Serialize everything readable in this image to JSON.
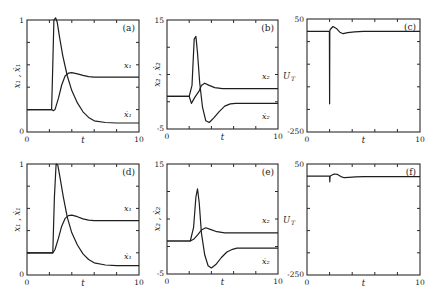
{
  "figure": {
    "width": 438,
    "height": 302
  },
  "chart_data": [
    {
      "id": "a",
      "type": "line",
      "panel_label": "(a)",
      "xlabel": "t",
      "ylabel": "x₁ , ẋ₁",
      "xlim": [
        0,
        10
      ],
      "ylim": [
        0,
        1
      ],
      "xtick_labels": [
        "0",
        "10"
      ],
      "ytick_labels": [
        "0",
        "1"
      ],
      "xticks": [
        0,
        2,
        4,
        6,
        8,
        10
      ],
      "yticks": [
        0,
        0.2,
        0.4,
        0.6,
        0.8,
        1
      ],
      "box": [
        27,
        20,
        139,
        132
      ],
      "series": [
        {
          "name": "x₁",
          "label_pos": [
            9.0,
            0.57
          ],
          "x": [
            0,
            2.2,
            2.35,
            2.5,
            2.8,
            3.1,
            3.4,
            3.7,
            4.0,
            4.5,
            5.0,
            5.5,
            6.0,
            7.0,
            8.0,
            10
          ],
          "y": [
            0.2,
            0.2,
            0.19,
            0.2,
            0.3,
            0.42,
            0.5,
            0.525,
            0.53,
            0.52,
            0.505,
            0.495,
            0.49,
            0.49,
            0.49,
            0.49
          ]
        },
        {
          "name": "ẋ₁",
          "label_pos": [
            9.0,
            0.13
          ],
          "x": [
            0,
            2.2,
            2.3,
            2.4,
            2.55,
            2.7,
            2.9,
            3.2,
            3.6,
            4.0,
            4.5,
            5.0,
            5.5,
            6.0,
            7.0,
            8.0,
            10
          ],
          "y": [
            0.2,
            0.2,
            0.6,
            1.0,
            1.02,
            0.98,
            0.85,
            0.68,
            0.5,
            0.37,
            0.26,
            0.18,
            0.13,
            0.1,
            0.085,
            0.08,
            0.08
          ]
        }
      ]
    },
    {
      "id": "b",
      "type": "line",
      "panel_label": "(b)",
      "xlabel": "t",
      "ylabel": "x₂ , ẋ₂",
      "xlim": [
        0,
        10
      ],
      "ylim": [
        -5,
        15
      ],
      "xtick_labels": [
        "0",
        "10"
      ],
      "ytick_labels": [
        "-5",
        "15"
      ],
      "xticks": [
        0,
        2,
        4,
        6,
        8,
        10
      ],
      "yticks": [
        -5,
        0,
        5,
        10,
        15
      ],
      "box": [
        167,
        20,
        278,
        129
      ],
      "series": [
        {
          "name": "x₂",
          "label_pos": [
            8.9,
            4.2
          ],
          "x": [
            0,
            2.0,
            2.2,
            2.5,
            2.9,
            3.1,
            3.4,
            3.8,
            4.3,
            5.0,
            6.0,
            10
          ],
          "y": [
            1.0,
            1.0,
            -0.3,
            0.8,
            2.0,
            3.0,
            3.4,
            3.0,
            2.6,
            2.4,
            2.4,
            2.4
          ]
        },
        {
          "name": "ẋ₂",
          "label_pos": [
            8.9,
            -3.2
          ],
          "x": [
            0,
            2.0,
            2.25,
            2.45,
            2.6,
            2.75,
            2.95,
            3.2,
            3.5,
            3.8,
            4.2,
            4.7,
            5.2,
            5.7,
            6.2,
            10
          ],
          "y": [
            1.0,
            1.0,
            3.0,
            11.5,
            12.0,
            9.0,
            3.5,
            -1.0,
            -3.5,
            -3.8,
            -3.0,
            -1.8,
            -0.8,
            -0.4,
            -0.3,
            -0.3
          ]
        }
      ]
    },
    {
      "id": "c",
      "type": "line",
      "panel_label": "(c)",
      "xlabel": "t",
      "ylabel": "U_T",
      "xlim": [
        0,
        10
      ],
      "ylim": [
        -250,
        50
      ],
      "xtick_labels": [
        "0",
        "10"
      ],
      "ytick_labels": [
        "-250",
        "50"
      ],
      "xticks": [
        0,
        2,
        4,
        6,
        8,
        10
      ],
      "yticks": [
        -250,
        -190,
        -130,
        -70,
        -10,
        50
      ],
      "box": [
        307,
        19,
        420,
        132
      ],
      "series": [
        {
          "name": "U_T",
          "x": [
            0,
            1.98,
            2.0,
            2.02,
            2.05,
            2.3,
            2.6,
            2.9,
            3.2,
            3.6,
            4.2,
            5.0,
            10
          ],
          "y": [
            17,
            17,
            -175,
            17,
            22,
            30,
            25,
            15,
            11,
            14,
            16,
            17,
            17
          ]
        }
      ]
    },
    {
      "id": "d",
      "type": "line",
      "panel_label": "(d)",
      "xlabel": "t",
      "ylabel": "x₁ , ẋ₁",
      "xlim": [
        0,
        10
      ],
      "ylim": [
        0,
        1
      ],
      "xtick_labels": [
        "0",
        "10"
      ],
      "ytick_labels": [
        "0",
        "1"
      ],
      "xticks": [
        0,
        2,
        4,
        6,
        8,
        10
      ],
      "yticks": [
        0,
        0.2,
        0.4,
        0.6,
        0.8,
        1
      ],
      "box": [
        27,
        164,
        139,
        275
      ],
      "series": [
        {
          "name": "x₁",
          "label_pos": [
            9.0,
            0.58
          ],
          "x": [
            0,
            2.3,
            2.5,
            2.8,
            3.1,
            3.4,
            3.7,
            4.0,
            4.5,
            5.0,
            5.5,
            6.0,
            7.0,
            8.0,
            10
          ],
          "y": [
            0.2,
            0.2,
            0.23,
            0.33,
            0.44,
            0.51,
            0.535,
            0.54,
            0.525,
            0.505,
            0.495,
            0.49,
            0.49,
            0.49,
            0.49
          ]
        },
        {
          "name": "ẋ₁",
          "label_pos": [
            9.0,
            0.14
          ],
          "x": [
            0,
            2.3,
            2.45,
            2.6,
            2.75,
            2.95,
            3.25,
            3.6,
            4.0,
            4.5,
            5.0,
            5.5,
            6.0,
            7.0,
            8.0,
            10
          ],
          "y": [
            0.2,
            0.2,
            0.7,
            1.0,
            0.99,
            0.88,
            0.7,
            0.52,
            0.38,
            0.27,
            0.19,
            0.14,
            0.11,
            0.09,
            0.085,
            0.085
          ]
        }
      ]
    },
    {
      "id": "e",
      "type": "line",
      "panel_label": "(e)",
      "xlabel": "t",
      "ylabel": "x₂ , ẋ₂",
      "xlim": [
        0,
        10
      ],
      "ylim": [
        -5,
        15
      ],
      "xtick_labels": [
        "0",
        "10"
      ],
      "ytick_labels": [
        "-5",
        "15"
      ],
      "xticks": [
        0,
        2,
        4,
        6,
        8,
        10
      ],
      "yticks": [
        -5,
        0,
        5,
        10,
        15
      ],
      "box": [
        167,
        164,
        278,
        274
      ],
      "series": [
        {
          "name": "x₂",
          "label_pos": [
            8.9,
            4.2
          ],
          "x": [
            0,
            2.1,
            2.4,
            2.8,
            3.1,
            3.5,
            3.9,
            4.5,
            5.2,
            6.0,
            10
          ],
          "y": [
            1.0,
            1.0,
            1.3,
            2.2,
            3.0,
            3.4,
            3.1,
            2.7,
            2.5,
            2.5,
            2.5
          ]
        },
        {
          "name": "ẋ₂",
          "label_pos": [
            8.9,
            -3.2
          ],
          "x": [
            0,
            2.1,
            2.4,
            2.6,
            2.75,
            2.9,
            3.1,
            3.4,
            3.7,
            4.0,
            4.4,
            4.9,
            5.4,
            5.9,
            6.3,
            10
          ],
          "y": [
            1.0,
            1.0,
            3.5,
            9.0,
            10.5,
            8.0,
            2.5,
            -1.5,
            -3.5,
            -3.9,
            -3.3,
            -2.0,
            -1.0,
            -0.5,
            -0.3,
            -0.3
          ]
        }
      ]
    },
    {
      "id": "f",
      "type": "line",
      "panel_label": "(f)",
      "xlabel": "t",
      "ylabel": "U_T",
      "xlim": [
        0,
        10
      ],
      "ylim": [
        -250,
        50
      ],
      "xtick_labels": [
        "0",
        "10"
      ],
      "ytick_labels": [
        "-250",
        "50"
      ],
      "xticks": [
        0,
        2,
        4,
        6,
        8,
        10
      ],
      "yticks": [
        -250,
        -190,
        -130,
        -70,
        -10,
        50
      ],
      "box": [
        307,
        164,
        420,
        275
      ],
      "series": [
        {
          "name": "U_T",
          "x": [
            0,
            2.0,
            2.02,
            2.04,
            2.1,
            2.4,
            2.7,
            3.0,
            3.3,
            3.7,
            4.3,
            5.0,
            10
          ],
          "y": [
            17,
            17,
            2,
            17,
            18,
            23,
            22,
            16,
            13,
            14,
            15,
            16,
            16
          ]
        }
      ]
    }
  ]
}
